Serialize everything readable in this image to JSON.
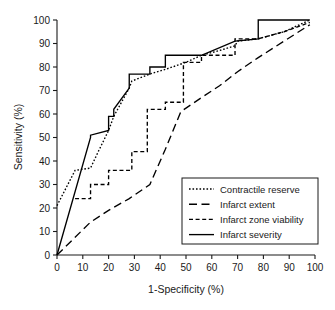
{
  "chart_data": {
    "type": "line",
    "title": "",
    "xlabel": "1-Specificity (%)",
    "ylabel": "Sensitivity (%)",
    "xlim": [
      0,
      100
    ],
    "ylim": [
      0,
      100
    ],
    "grid": false,
    "legend_position": "lower-right",
    "xticks": [
      "0",
      "10",
      "20",
      "30",
      "40",
      "50",
      "60",
      "70",
      "80",
      "90",
      "100"
    ],
    "yticks": [
      "0",
      "10",
      "20",
      "30",
      "40",
      "50",
      "60",
      "70",
      "80",
      "90",
      "100"
    ],
    "xtick_values": [
      0,
      10,
      20,
      30,
      40,
      50,
      60,
      70,
      80,
      90,
      100
    ],
    "ytick_values": [
      0,
      10,
      20,
      30,
      40,
      50,
      60,
      70,
      80,
      90,
      100
    ],
    "series": [
      {
        "name": "Contractile reserve",
        "dash": "dotted",
        "dasharray": "1.6,1.9",
        "points": [
          [
            0,
            21
          ],
          [
            7,
            36
          ],
          [
            13,
            37
          ],
          [
            16,
            44
          ],
          [
            20,
            53
          ],
          [
            22,
            59
          ],
          [
            28,
            71
          ],
          [
            29,
            74
          ],
          [
            36,
            77
          ],
          [
            42,
            79
          ],
          [
            50,
            82
          ],
          [
            56,
            85
          ],
          [
            63,
            87
          ],
          [
            69,
            89
          ],
          [
            70,
            91
          ],
          [
            78,
            92
          ],
          [
            88,
            95
          ],
          [
            98,
            100
          ]
        ]
      },
      {
        "name": "Infarct extent",
        "dash": "long-dash",
        "dasharray": "8,4.5",
        "points": [
          [
            0,
            0
          ],
          [
            13,
            14
          ],
          [
            20,
            19
          ],
          [
            28,
            24
          ],
          [
            36,
            30
          ],
          [
            42,
            45
          ],
          [
            48,
            61
          ],
          [
            56,
            67
          ],
          [
            63,
            72
          ],
          [
            70,
            78
          ],
          [
            78,
            84
          ],
          [
            88,
            91
          ],
          [
            98,
            98
          ]
        ]
      },
      {
        "name": "Infarct zone viability",
        "dash": "short-dash",
        "dasharray": "4,2.6",
        "points": [
          [
            7,
            24
          ],
          [
            13,
            24
          ],
          [
            13,
            30
          ],
          [
            20,
            30
          ],
          [
            20,
            36
          ],
          [
            29,
            36
          ],
          [
            29,
            44
          ],
          [
            35,
            44
          ],
          [
            35,
            62
          ],
          [
            42,
            62
          ],
          [
            42,
            65
          ],
          [
            49,
            65
          ],
          [
            49,
            82
          ],
          [
            56,
            82
          ],
          [
            56,
            85
          ],
          [
            69,
            85
          ],
          [
            69,
            92
          ],
          [
            78,
            92
          ],
          [
            88,
            95
          ],
          [
            98,
            99
          ]
        ]
      },
      {
        "name": "Infarct severity",
        "dash": "solid",
        "dasharray": "",
        "points": [
          [
            0,
            0
          ],
          [
            13,
            50
          ],
          [
            13,
            51
          ],
          [
            20,
            53
          ],
          [
            20,
            59
          ],
          [
            22,
            59
          ],
          [
            22,
            62
          ],
          [
            28,
            71
          ],
          [
            28,
            77
          ],
          [
            36,
            77
          ],
          [
            36,
            80
          ],
          [
            42,
            80
          ],
          [
            42,
            85
          ],
          [
            56,
            85
          ],
          [
            69,
            91
          ],
          [
            78,
            92
          ],
          [
            78,
            100
          ],
          [
            98,
            100
          ]
        ]
      }
    ]
  },
  "legend": {
    "items": [
      {
        "label": "Contractile reserve"
      },
      {
        "label": "Infarct extent"
      },
      {
        "label": "Infarct zone viability"
      },
      {
        "label": "Infarct severity"
      }
    ]
  },
  "colors": {
    "line": "#000000",
    "axis": "#1a1a1a",
    "background": "#ffffff"
  }
}
